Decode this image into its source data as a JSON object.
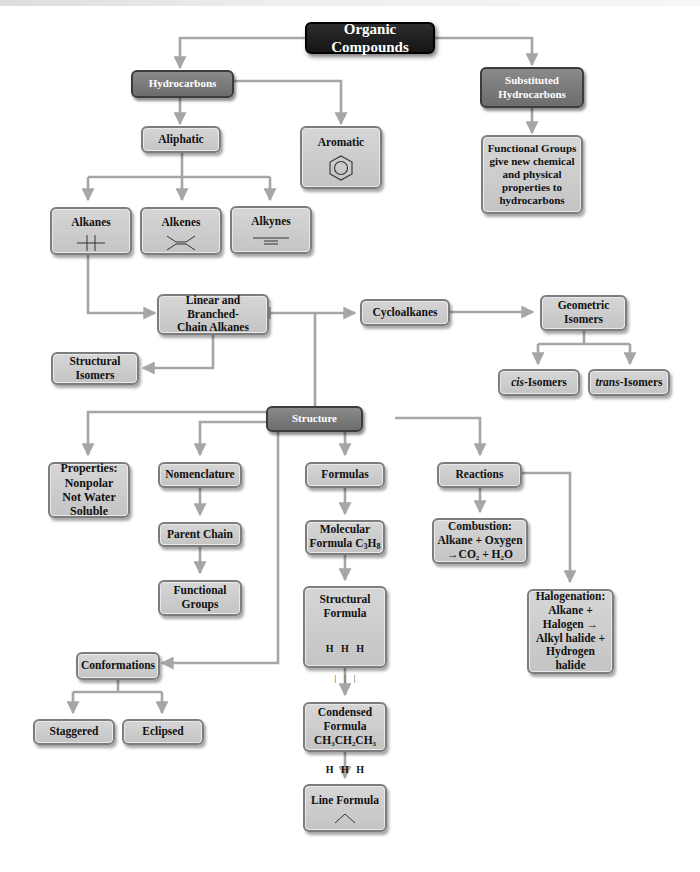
{
  "diagram": {
    "title": "Organic Compounds",
    "colors": {
      "connector": "#a6a6a6",
      "root_fill": "#1e1e1e",
      "category_fill": "#7a7a7a",
      "node_fill": "#cccccc",
      "node_border": "#7d7d7d"
    },
    "nodes": {
      "organic_compounds": "Organic Compounds",
      "hydrocarbons": "Hydrocarbons",
      "substituted_hydrocarbons": [
        "Substituted",
        "Hydrocarbons"
      ],
      "aliphatic": "Aliphatic",
      "aromatic": "Aromatic",
      "functional_groups_note": [
        "Functional Groups",
        "give new chemical",
        "and physical",
        "properties to",
        "hydrocarbons"
      ],
      "alkanes": "Alkanes",
      "alkenes": "Alkenes",
      "alkynes": "Alkynes",
      "linear_branched": [
        "Linear and Branched-",
        "Chain Alkanes"
      ],
      "structural_isomers": [
        "Structural",
        "Isomers"
      ],
      "cycloalkanes": "Cycloalkanes",
      "geometric_isomers": [
        "Geometric",
        "Isomers"
      ],
      "cis_isomers": {
        "prefix": "cis",
        "suffix": "-Isomers"
      },
      "trans_isomers": {
        "prefix": "trans",
        "suffix": "-Isomers"
      },
      "structure": "Structure",
      "properties": [
        "Properties:",
        "Nonpolar",
        "Not Water",
        "Soluble"
      ],
      "nomenclature": "Nomenclature",
      "parent_chain": "Parent Chain",
      "functional_groups": [
        "Functional",
        "Groups"
      ],
      "formulas": "Formulas",
      "molecular_formula": {
        "line1": "Molecular",
        "line2": "Formula C",
        "sub1": "3",
        "mid": "H",
        "sub2": "8"
      },
      "structural_formula": {
        "line1": "Structural",
        "line2": "Formula",
        "drawing": [
          "H   H   H",
          "|    |    |",
          "H–C–C–C–H",
          "|    |    |",
          "H   H   H"
        ]
      },
      "condensed_formula": {
        "line1": "Condensed",
        "line2": "Formula",
        "formula": "CH₃CH₂CH₃"
      },
      "line_formula": "Line Formula",
      "reactions": "Reactions",
      "combustion": [
        "Combustion:",
        "Alkane + Oxygen",
        "→CO₂ + H₂O"
      ],
      "halogenation": [
        "Halogenation:",
        "Alkane +",
        "Halogen →",
        "Alkyl halide +",
        "Hydrogen",
        "halide"
      ],
      "conformations": "Conformations",
      "staggered": "Staggered",
      "eclipsed": "Eclipsed"
    },
    "icons": {
      "aromatic": "benzene-ring-icon",
      "alkanes": "single-bond-icon",
      "alkenes": "double-bond-icon",
      "alkynes": "triple-bond-icon",
      "line_formula": "zigzag-line-icon"
    }
  }
}
